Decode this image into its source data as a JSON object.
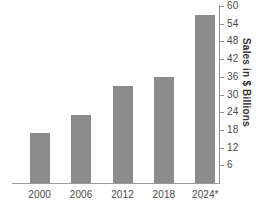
{
  "chart_data": {
    "type": "bar",
    "title": "",
    "subtitle": "",
    "xlabel": "",
    "ylabel": "Sales in $ Billions",
    "categories": [
      "2000",
      "2006",
      "2012",
      "2018",
      "2024*"
    ],
    "values": [
      17,
      23,
      33,
      36,
      57
    ],
    "series": [
      {
        "name": "Sales",
        "values": [
          17,
          23,
          33,
          36,
          57
        ]
      }
    ],
    "ylim": [
      0,
      60
    ],
    "y_ticks": [
      6,
      12,
      18,
      24,
      30,
      36,
      42,
      48,
      54,
      60
    ],
    "y_tick_labels": [
      "6",
      "12",
      "18",
      "24",
      "30",
      "36",
      "42",
      "48",
      "54",
      "60"
    ],
    "y_axis_position": "right",
    "grid": false,
    "legend": null,
    "legend_position": "none",
    "annotations": [],
    "bar_color": "#8b8b8b",
    "axis_color": "#8f8f8f",
    "tick_label_color": "#4a4a4a",
    "axis_title_color": "#2f2f2f",
    "background_color": "#ffffff"
  }
}
